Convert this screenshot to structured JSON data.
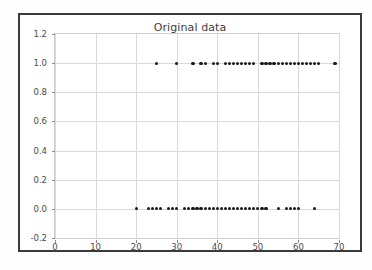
{
  "chart_data": {
    "type": "scatter",
    "title": "Original data",
    "xlabel": "",
    "ylabel": "",
    "xlim": [
      0,
      70
    ],
    "ylim": [
      -0.2,
      1.2
    ],
    "xticks": [
      0,
      10,
      20,
      30,
      40,
      50,
      60,
      70
    ],
    "yticks": [
      -0.2,
      0.0,
      0.2,
      0.4,
      0.6,
      0.8,
      1.0,
      1.2
    ],
    "xtick_labels": [
      "0",
      "10",
      "20",
      "30",
      "40",
      "50",
      "60",
      "70"
    ],
    "ytick_labels": [
      "-0.2",
      "0.0",
      "0.2",
      "0.4",
      "0.6",
      "0.8",
      "1.0",
      "1.2"
    ],
    "grid": true,
    "legend": null,
    "marker": "circle",
    "marker_color": "#1a1a1a",
    "marker_size": 3,
    "series": [
      {
        "name": "class 1",
        "y_value": 1.0,
        "x": [
          25,
          30,
          34,
          36,
          37,
          39,
          40,
          42,
          43,
          44,
          45,
          46,
          47,
          48,
          49,
          51,
          52,
          53,
          54,
          55,
          56,
          57,
          58,
          59,
          60,
          61,
          62,
          63,
          64,
          65,
          69
        ]
      },
      {
        "name": "class 0",
        "y_value": 0.0,
        "x": [
          20,
          23,
          24,
          25,
          26,
          28,
          29,
          30,
          32,
          33,
          34,
          35,
          36,
          37,
          38,
          39,
          40,
          41,
          42,
          43,
          44,
          45,
          46,
          47,
          48,
          49,
          50,
          51,
          52,
          55,
          57,
          58,
          59,
          60,
          64
        ]
      }
    ]
  },
  "figure": {
    "title": "Original data"
  }
}
